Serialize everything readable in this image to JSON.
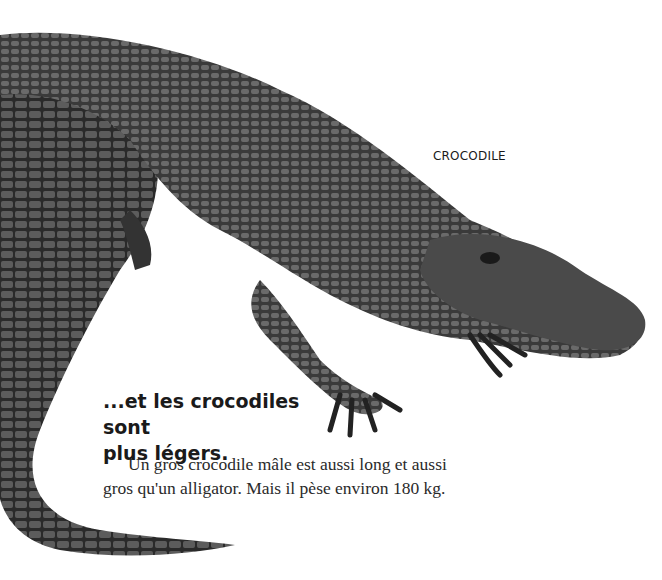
{
  "illustration": {
    "subject": "crocodile",
    "label": "CROCODILE"
  },
  "text": {
    "heading_line1": "...et les crocodiles sont",
    "heading_line2": "plus légers.",
    "body_line1": "Un gros crocodile mâle est aussi long et aussi",
    "body_line2": "gros qu'un alligator. Mais il pèse environ 180 kg."
  }
}
